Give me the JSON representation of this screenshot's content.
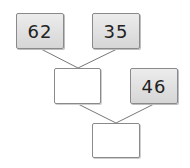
{
  "diagram": {
    "type": "addition-tree",
    "nodes": [
      {
        "id": "a",
        "value": "62",
        "filled": true
      },
      {
        "id": "b",
        "value": "35",
        "filled": true
      },
      {
        "id": "sum1",
        "value": "",
        "filled": false
      },
      {
        "id": "c",
        "value": "46",
        "filled": true
      },
      {
        "id": "sum2",
        "value": "",
        "filled": false
      }
    ],
    "edges": [
      [
        "a",
        "sum1"
      ],
      [
        "b",
        "sum1"
      ],
      [
        "sum1",
        "sum2"
      ],
      [
        "c",
        "sum2"
      ]
    ],
    "colors": {
      "filled_box": "#dedede",
      "border": "#8a8a8a",
      "line": "#777777"
    }
  }
}
